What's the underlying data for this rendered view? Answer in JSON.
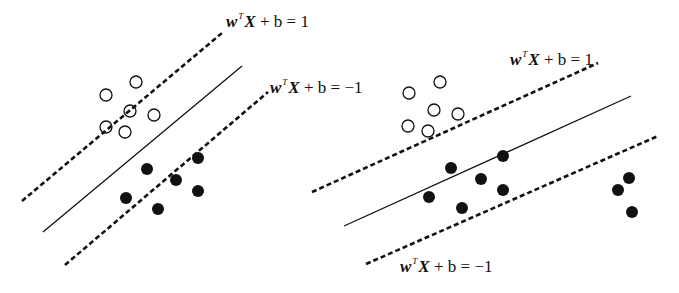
{
  "figure": {
    "colors": {
      "ink": "#111111",
      "background": "#ffffff"
    },
    "panels": [
      {
        "name": "left-panel",
        "caption": "",
        "lines": {
          "upper_margin": {
            "x1": 22,
            "y1": 201,
            "x2": 222,
            "y2": 33,
            "style": "dashed"
          },
          "decision_boundary": {
            "x1": 43,
            "y1": 232,
            "x2": 242,
            "y2": 66,
            "style": "solid"
          },
          "lower_margin": {
            "x1": 65,
            "y1": 265,
            "x2": 268,
            "y2": 92,
            "style": "dashed"
          }
        },
        "labels": {
          "upper": {
            "w": "w",
            "sup": "T",
            "X": "X",
            "rest": " + b = 1",
            "x": 226,
            "y": 12
          },
          "lower": {
            "w": "w",
            "sup": "T",
            "X": "X",
            "rest": " + b = −1",
            "x": 270,
            "y": 78
          }
        },
        "open_points": [
          [
            106,
            95
          ],
          [
            136,
            82
          ],
          [
            130,
            111
          ],
          [
            154,
            115
          ],
          [
            106,
            127
          ],
          [
            125,
            132
          ]
        ],
        "filled_points": [
          [
            147,
            169
          ],
          [
            176,
            180
          ],
          [
            198,
            158
          ],
          [
            198,
            191
          ],
          [
            126,
            198
          ],
          [
            158,
            209
          ]
        ]
      },
      {
        "name": "right-panel",
        "caption": "",
        "lines": {
          "upper_margin": {
            "x1": 312,
            "y1": 192,
            "x2": 598,
            "y2": 63,
            "style": "dashed"
          },
          "decision_boundary": {
            "x1": 344,
            "y1": 226,
            "x2": 631,
            "y2": 96,
            "style": "solid"
          },
          "lower_margin": {
            "x1": 366,
            "y1": 264,
            "x2": 658,
            "y2": 136,
            "style": "dashed"
          }
        },
        "labels": {
          "upper": {
            "w": "w",
            "sup": "T",
            "X": "X",
            "rest": " + b = 1",
            "x": 510,
            "y": 50
          },
          "lower": {
            "w": "w",
            "sup": "T",
            "X": "X",
            "rest": " + b = −1",
            "x": 400,
            "y": 257
          }
        },
        "open_points": [
          [
            409,
            93
          ],
          [
            440,
            82
          ],
          [
            434,
            110
          ],
          [
            458,
            114
          ],
          [
            408,
            126
          ],
          [
            428,
            131
          ]
        ],
        "filled_points": [
          [
            451,
            168
          ],
          [
            481,
            179
          ],
          [
            503,
            156
          ],
          [
            503,
            190
          ],
          [
            429,
            197
          ],
          [
            462,
            208
          ],
          [
            629,
            178
          ],
          [
            618,
            190
          ],
          [
            632,
            212
          ]
        ]
      }
    ],
    "point_radius": 6
  }
}
